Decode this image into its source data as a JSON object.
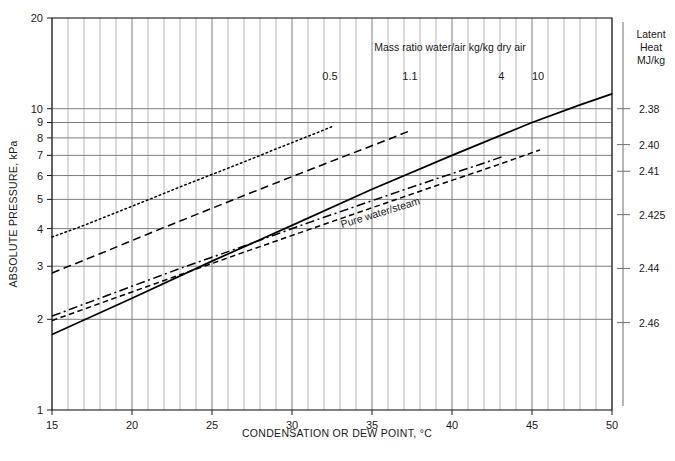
{
  "chart_data": {
    "type": "line",
    "title": "",
    "xlabel": "CONDENSATION OR DEW POINT, °C",
    "ylabel": "ABSOLUTE PRESSURE, kPa",
    "xlim": [
      15,
      50
    ],
    "ylim": [
      1,
      20
    ],
    "yscale": "log",
    "grid": true,
    "legend": "inline-curve-labels",
    "xticks": [
      15,
      20,
      25,
      30,
      35,
      40,
      45,
      50
    ],
    "xtick_labels": [
      "15",
      "20",
      "25",
      "30",
      "35",
      "40",
      "45",
      "50"
    ],
    "yticks": [
      1,
      2,
      3,
      4,
      5,
      6,
      7,
      8,
      9,
      10,
      20
    ],
    "ytick_labels": [
      "1",
      "2",
      "3",
      "4",
      "5",
      "6",
      "7",
      "8",
      "9",
      "10",
      "20"
    ],
    "annotations": [
      {
        "name": "mass-ratio-note",
        "text": "Mass ratio water/air kg/kg dry air",
        "x": 36.0,
        "y_px": 51
      },
      {
        "name": "pure-water-steam-label",
        "text": "Pure water/steam",
        "x": 33.5,
        "rotation": -17
      }
    ],
    "secondary_axis": {
      "title_lines": [
        "Latent",
        "Heat",
        "MJ/kg"
      ],
      "ticks": [
        {
          "label": "2.38",
          "pressure": 10.0
        },
        {
          "label": "2.40",
          "pressure": 7.6
        },
        {
          "label": "2.41",
          "pressure": 6.2
        },
        {
          "label": "2.425",
          "pressure": 4.45
        },
        {
          "label": "2.44",
          "pressure": 2.95
        },
        {
          "label": "2.46",
          "pressure": 1.95
        }
      ]
    },
    "series": [
      {
        "name": "0.5",
        "label": "0.5",
        "style": "dotted",
        "label_x": 31.0,
        "points": [
          [
            15,
            3.75
          ],
          [
            17,
            4.1
          ],
          [
            19,
            4.52
          ],
          [
            21,
            4.98
          ],
          [
            23,
            5.5
          ],
          [
            25,
            6.05
          ],
          [
            27,
            6.66
          ],
          [
            29,
            7.35
          ],
          [
            31,
            8.1
          ],
          [
            32,
            8.5
          ],
          [
            32.5,
            8.72
          ]
        ]
      },
      {
        "name": "1.1",
        "label": "1.1",
        "style": "dashed",
        "label_x": 37.0,
        "points": [
          [
            15,
            2.85
          ],
          [
            18,
            3.3
          ],
          [
            21,
            3.84
          ],
          [
            24,
            4.45
          ],
          [
            27,
            5.15
          ],
          [
            30,
            5.95
          ],
          [
            33,
            6.86
          ],
          [
            36,
            7.9
          ],
          [
            37.5,
            8.5
          ]
        ]
      },
      {
        "name": "4",
        "label": "4",
        "style": "dash-dot",
        "label_x": 42.3,
        "points": [
          [
            15,
            2.05
          ],
          [
            19,
            2.46
          ],
          [
            23,
            2.95
          ],
          [
            27,
            3.5
          ],
          [
            31,
            4.18
          ],
          [
            35,
            4.95
          ],
          [
            39,
            5.85
          ],
          [
            42,
            6.6
          ],
          [
            43.2,
            6.95
          ]
        ]
      },
      {
        "name": "10",
        "label": "10",
        "style": "dashed-short",
        "label_x": 45.2,
        "points": [
          [
            15,
            1.98
          ],
          [
            19,
            2.36
          ],
          [
            23,
            2.81
          ],
          [
            27,
            3.34
          ],
          [
            31,
            3.96
          ],
          [
            35,
            4.69
          ],
          [
            39,
            5.55
          ],
          [
            43,
            6.55
          ],
          [
            45.5,
            7.3
          ]
        ]
      },
      {
        "name": "pure-water-steam",
        "label": "Pure water/steam",
        "style": "solid",
        "label_x": 33.5,
        "points": [
          [
            15,
            1.78
          ],
          [
            20,
            2.35
          ],
          [
            25,
            3.12
          ],
          [
            30,
            4.1
          ],
          [
            35,
            5.4
          ],
          [
            40,
            7.0
          ],
          [
            45,
            9.0
          ],
          [
            48,
            10.3
          ],
          [
            50,
            11.2
          ]
        ]
      }
    ]
  },
  "page": {
    "background": "#ffffff",
    "grid_color": "#8d8d8d",
    "axis_color": "#1a1a1a",
    "line_color": "#000000"
  }
}
